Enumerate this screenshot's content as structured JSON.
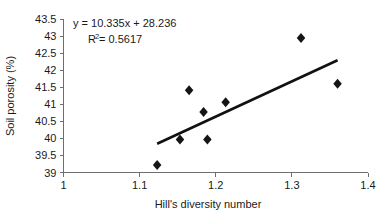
{
  "chart_data": {
    "type": "scatter",
    "title": "",
    "xlabel": "Hill's diversity number",
    "ylabel": "Soil porosity (%)",
    "xlim": [
      1,
      1.4
    ],
    "ylim": [
      39,
      43.5
    ],
    "grid": false,
    "legend": null,
    "x_ticks": [
      "1",
      "1.1",
      "1.2",
      "1.3",
      "1.4"
    ],
    "x_tick_values": [
      1,
      1.1,
      1.2,
      1.3,
      1.4
    ],
    "y_ticks": [
      "39",
      "39.5",
      "40",
      "40.5",
      "41",
      "41.5",
      "42",
      "42.5",
      "43",
      "43.5"
    ],
    "y_tick_values": [
      39,
      39.5,
      40,
      40.5,
      41,
      41.5,
      42,
      42.5,
      43,
      43.5
    ],
    "points": [
      {
        "x": 1.123,
        "y": 39.22
      },
      {
        "x": 1.153,
        "y": 39.97
      },
      {
        "x": 1.165,
        "y": 41.41
      },
      {
        "x": 1.184,
        "y": 40.77
      },
      {
        "x": 1.189,
        "y": 39.97
      },
      {
        "x": 1.213,
        "y": 41.06
      },
      {
        "x": 1.312,
        "y": 42.94
      },
      {
        "x": 1.36,
        "y": 41.6
      }
    ],
    "marker": {
      "shape": "diamond",
      "color": "#151515",
      "size": 5
    },
    "trendline": {
      "type": "linear",
      "slope": 10.335,
      "intercept": 28.236,
      "x_start": 1.123,
      "x_end": 1.36,
      "color": "#111111",
      "width": 2.6
    },
    "annotations": {
      "equation": "y = 10.335x + 28.236",
      "r_squared_prefix": "R",
      "r_squared_sup": "2",
      "r_squared_value": " = 0.5617"
    }
  },
  "colors": {
    "axis": "#6e6e6e",
    "text": "#1a1a1a",
    "marker": "#151515",
    "trendline": "#111111",
    "background": "#ffffff"
  }
}
